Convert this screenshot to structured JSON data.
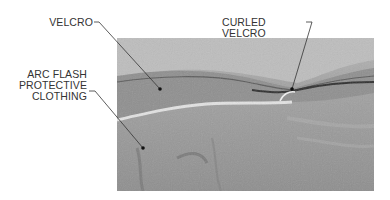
{
  "figure": {
    "labels": {
      "velcro": "VELCRO",
      "curled_velcro": "CURLED VELCRO",
      "arc_flash_line1": "ARC FLASH",
      "arc_flash_line2": "PROTECTIVE",
      "arc_flash_line3": "CLOTHING"
    },
    "colors": {
      "label_text": "#333333",
      "leader_line": "#333333",
      "photo_background": "#9a9a9a"
    }
  }
}
